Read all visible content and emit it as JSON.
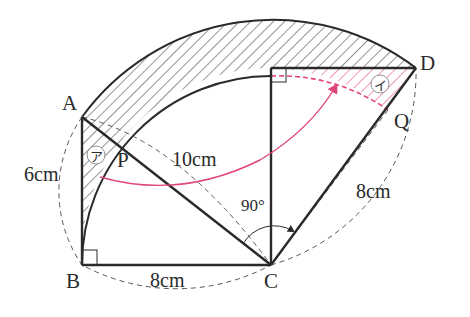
{
  "figure": {
    "points": {
      "A": "A",
      "B": "B",
      "C": "C",
      "D": "D",
      "P": "P",
      "Q": "Q"
    },
    "dimensions": {
      "AB": "6cm",
      "BC": "8cm",
      "AC": "10cm",
      "CD": "8cm",
      "angle": "90°"
    },
    "regions": {
      "a": "ア",
      "b": "イ"
    },
    "colors": {
      "line": "#2a2a2a",
      "hatch": "#3a3a3a",
      "highlight": "#e0457b"
    }
  }
}
